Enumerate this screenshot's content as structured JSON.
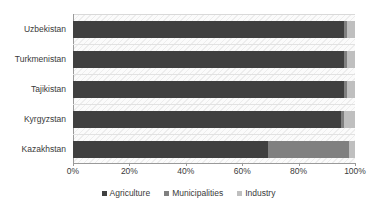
{
  "chart_data": {
    "type": "bar",
    "orientation": "horizontal",
    "stacked": true,
    "normalized": true,
    "title": "",
    "xlabel": "",
    "ylabel": "",
    "xlim": [
      0,
      100
    ],
    "xticks": [
      "0%",
      "20%",
      "40%",
      "60%",
      "80%",
      "100%"
    ],
    "xtick_values": [
      0,
      20,
      40,
      60,
      80,
      100
    ],
    "grid": true,
    "legend_position": "bottom",
    "categories": [
      "Uzbekistan",
      "Turkmenistan",
      "Tajikistan",
      "Kyrgyzstan",
      "Kazakhstan"
    ],
    "series": [
      {
        "name": "Agriculture",
        "color": "#404040",
        "values": [
          96,
          96,
          96,
          95,
          69
        ]
      },
      {
        "name": "Municipalities",
        "color": "#808080",
        "values": [
          1,
          1,
          1,
          1,
          29
        ]
      },
      {
        "name": "Industry",
        "color": "#bfbfbf",
        "values": [
          3,
          3,
          3,
          4,
          2
        ]
      }
    ]
  },
  "legend": {
    "items": [
      {
        "label": "Agriculture",
        "marker": "square-marker-icon"
      },
      {
        "label": "Municipalities",
        "marker": "square-marker-icon"
      },
      {
        "label": "Industry",
        "marker": "square-marker-icon"
      }
    ]
  }
}
